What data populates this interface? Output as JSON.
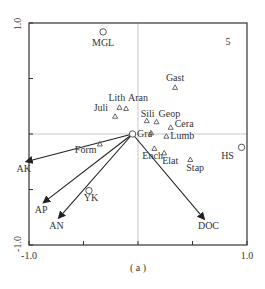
{
  "chart_data": {
    "type": "scatter",
    "subtype": "ordination_biplot",
    "title": "",
    "caption": "( a )",
    "xlabel": "",
    "ylabel": "",
    "xlim": [
      -1.0,
      1.0
    ],
    "ylim": [
      -1.0,
      1.0
    ],
    "x_tick_labels": [
      "-1.0",
      "1.0"
    ],
    "y_tick_labels": [
      "1.0",
      "-1.0"
    ],
    "corner_label": "5",
    "grid": false,
    "zero_lines": true,
    "sites": [
      {
        "label": "MGL",
        "x": -0.32,
        "y": 0.92
      },
      {
        "label": "HS",
        "x": 0.95,
        "y": -0.12
      },
      {
        "label": "YK",
        "x": -0.45,
        "y": -0.51
      },
      {
        "label": "",
        "x": -0.05,
        "y": 0.0
      }
    ],
    "species": [
      {
        "label": "Gast",
        "x": 0.34,
        "y": 0.42
      },
      {
        "label": "Aran",
        "x": -0.11,
        "y": 0.23
      },
      {
        "label": "Lith",
        "x": -0.17,
        "y": 0.24
      },
      {
        "label": "Juli",
        "x": -0.21,
        "y": 0.16
      },
      {
        "label": "Sili",
        "x": 0.08,
        "y": 0.12
      },
      {
        "label": "Geop",
        "x": 0.17,
        "y": 0.11
      },
      {
        "label": "Cera",
        "x": 0.3,
        "y": 0.06
      },
      {
        "label": "Gra",
        "x": 0.12,
        "y": 0.01
      },
      {
        "label": "Lumb",
        "x": 0.26,
        "y": -0.02
      },
      {
        "label": "Ench",
        "x": 0.15,
        "y": -0.13
      },
      {
        "label": "Elat",
        "x": 0.24,
        "y": -0.17
      },
      {
        "label": "Stap",
        "x": 0.48,
        "y": -0.23
      },
      {
        "label": "Form",
        "x": -0.35,
        "y": -0.09
      }
    ],
    "env_vectors": [
      {
        "label": "AK",
        "x": -1.03,
        "y": -0.25
      },
      {
        "label": "AP",
        "x": -0.87,
        "y": -0.62
      },
      {
        "label": "AN",
        "x": -0.73,
        "y": -0.76
      },
      {
        "label": "DOC",
        "x": 0.61,
        "y": -0.77
      }
    ]
  },
  "colors": {
    "axis": "#333333",
    "zero_line": "#bbbbbb",
    "marker": "#444444",
    "arrow": "#222222",
    "text": "#333333"
  }
}
